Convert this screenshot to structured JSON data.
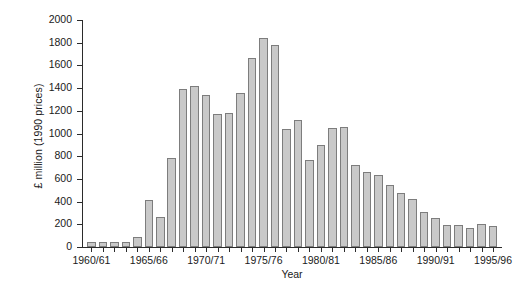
{
  "chart_data": {
    "type": "bar",
    "title": "",
    "xlabel": "Year",
    "ylabel": "£ million (1990 prices)",
    "ylim": [
      0,
      2000
    ],
    "ytick_values": [
      0,
      200,
      400,
      600,
      800,
      1000,
      1200,
      1400,
      1600,
      1800,
      2000
    ],
    "ytick_labels": [
      "0",
      "200",
      "400",
      "600",
      "800",
      "1000",
      "1200",
      "1400",
      "1600",
      "1800",
      "2000"
    ],
    "grid": false,
    "legend": null,
    "xtick_labels": [
      "1960/61",
      "1965/66",
      "1970/71",
      "1975/76",
      "1980/81",
      "1985/86",
      "1990/91",
      "1995/96"
    ],
    "xtick_categories": [
      "1960/61",
      "1965/66",
      "1970/71",
      "1975/76",
      "1980/81",
      "1985/86",
      "1990/91",
      "1995/96"
    ],
    "categories": [
      "1960/61",
      "1961/62",
      "1962/63",
      "1963/64",
      "1964/65",
      "1965/66",
      "1966/67",
      "1967/68",
      "1968/69",
      "1969/70",
      "1970/71",
      "1971/72",
      "1972/73",
      "1973/74",
      "1974/75",
      "1975/76",
      "1976/77",
      "1977/78",
      "1978/79",
      "1979/80",
      "1980/81",
      "1981/82",
      "1982/83",
      "1983/84",
      "1984/85",
      "1985/86",
      "1986/87",
      "1987/88",
      "1988/89",
      "1989/90",
      "1990/91",
      "1991/92",
      "1992/93",
      "1993/94",
      "1994/95",
      "1995/96"
    ],
    "values": [
      40,
      40,
      40,
      45,
      85,
      415,
      265,
      780,
      1390,
      1415,
      1340,
      1170,
      1180,
      1360,
      1665,
      1845,
      1780,
      1040,
      1115,
      770,
      900,
      1050,
      1060,
      720,
      665,
      630,
      545,
      480,
      420,
      310,
      255,
      190,
      195,
      165,
      205,
      185
    ]
  }
}
